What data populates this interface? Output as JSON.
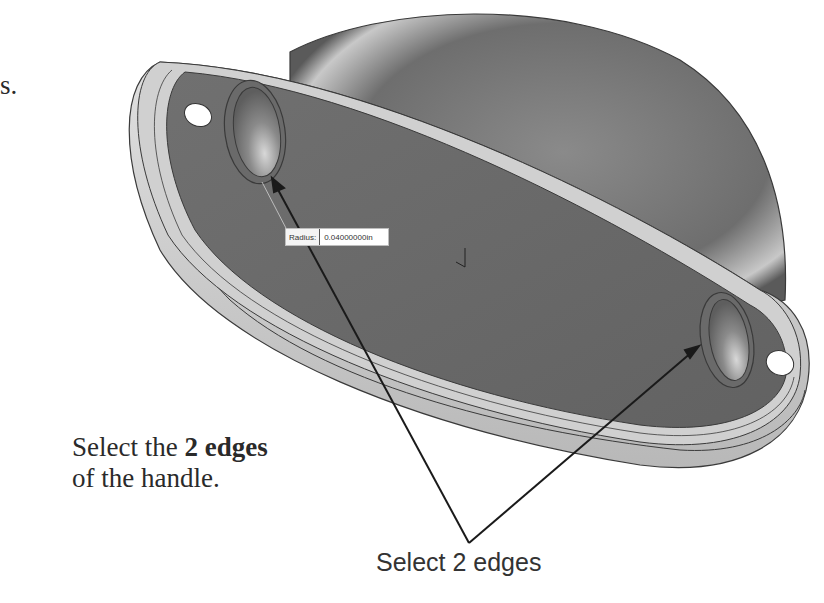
{
  "page": {
    "fragment_text": "s.",
    "instruction": {
      "prefix": "Select the ",
      "bold": "2 edges",
      "line2": "of the handle."
    },
    "callout_label": "Select 2 edges"
  },
  "viewport": {
    "radius_field": {
      "label": "Radius:",
      "value": "0.04000000in"
    },
    "triad_icon": "coordinate-triad",
    "colors": {
      "face_dark": "#6b6b6b",
      "flange_light": "#d4d4d4",
      "dome": "#7a7a7a",
      "edge_line": "#3a3a3a",
      "arrow": "#1a1a1a"
    }
  }
}
